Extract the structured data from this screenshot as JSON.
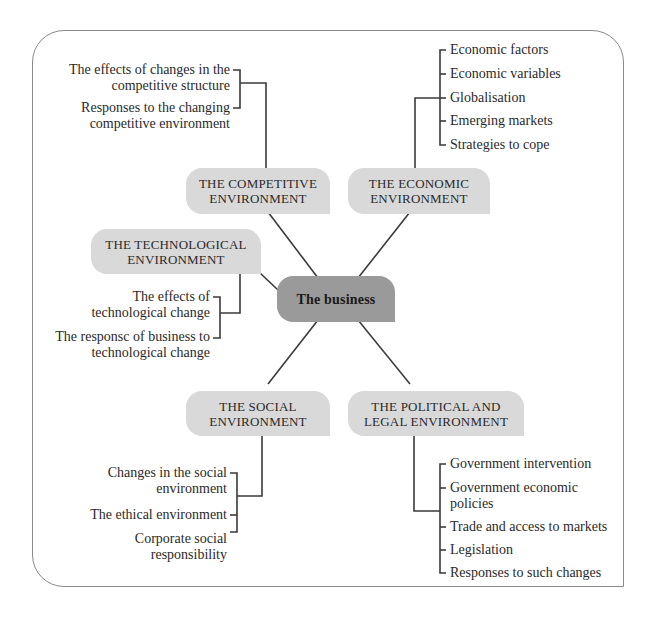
{
  "diagram": {
    "center": {
      "label": "The business"
    },
    "nodes": {
      "competitive": {
        "line1": "THE COMPETITIVE",
        "line2": "ENVIRONMENT",
        "items": [
          {
            "line1": "The effects of changes in the",
            "line2": "competitive structure"
          },
          {
            "line1": "Responses to the changing",
            "line2": "competitive environment"
          }
        ]
      },
      "economic": {
        "line1": "THE ECONOMIC",
        "line2": "ENVIRONMENT",
        "items": [
          "Economic factors",
          "Economic variables",
          "Globalisation",
          "Emerging markets",
          "Strategies to cope"
        ]
      },
      "technological": {
        "line1": "THE TECHNOLOGICAL",
        "line2": "ENVIRONMENT",
        "items": [
          {
            "line1": "The effects of",
            "line2": "technological change"
          },
          {
            "line1": "The responsc of business to",
            "line2": "technological change"
          }
        ]
      },
      "social": {
        "line1": "THE SOCIAL",
        "line2": "ENVIRONMENT",
        "items": [
          {
            "line1": "Changes in the social",
            "line2": "environment"
          },
          {
            "line1": "The ethical environment",
            "line2": ""
          },
          {
            "line1": "Corporate social",
            "line2": "responsibility"
          }
        ]
      },
      "political": {
        "line1": "THE POLITICAL AND",
        "line2": "LEGAL ENVIRONMENT",
        "items": [
          {
            "line1": "Government intervention",
            "line2": ""
          },
          {
            "line1": "Government economic",
            "line2": "policies"
          },
          {
            "line1": "Trade and access to markets",
            "line2": ""
          },
          {
            "line1": "Legislation",
            "line2": ""
          },
          {
            "line1": "Responses to such changes",
            "line2": ""
          }
        ]
      }
    },
    "colors": {
      "node_fill": "#d9d9d9",
      "center_fill": "#9a9a9a",
      "line": "#3a3a3a",
      "frame": "#8a8a8a"
    }
  }
}
